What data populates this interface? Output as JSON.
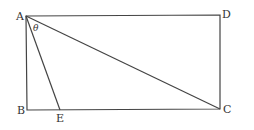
{
  "diagram": {
    "points": {
      "A": {
        "label": "A",
        "x": 26,
        "y": 16
      },
      "D": {
        "label": "D",
        "x": 220,
        "y": 15
      },
      "B": {
        "label": "B",
        "x": 27,
        "y": 110
      },
      "C": {
        "label": "C",
        "x": 220,
        "y": 109
      },
      "E": {
        "label": "E",
        "x": 60,
        "y": 110
      }
    },
    "angle_label": "θ",
    "segments": [
      "AD",
      "DC",
      "CB",
      "BA",
      "AC",
      "AE"
    ]
  }
}
